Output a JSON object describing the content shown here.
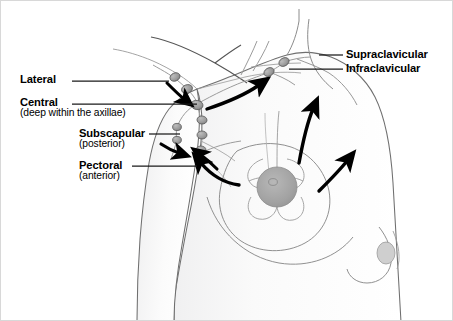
{
  "figure": {
    "background_color": "#ffffff",
    "width": 453,
    "height": 321
  },
  "labels": {
    "lateral": {
      "name": "Lateral",
      "qualifier": ""
    },
    "central": {
      "name": "Central",
      "qualifier": "(deep within the axillae)"
    },
    "subscapular": {
      "name": "Subscapular",
      "qualifier": "(posterior)"
    },
    "pectoral": {
      "name": "Pectoral",
      "qualifier": "(anterior)"
    },
    "supraclavicular": {
      "name": "Supraclavicular",
      "qualifier": ""
    },
    "infraclavicular": {
      "name": "Infraclavicular",
      "qualifier": ""
    }
  },
  "colors": {
    "text": "#000000",
    "leader_line": "#1a1a1a",
    "outline": "#6f6f6f",
    "skin_fill": "#fbfbfb",
    "skin_shade": "#ececed",
    "node_fill": "#9a9a9a",
    "node_stroke": "#5a5a5a",
    "vessel": "#8d8d8d",
    "arrow": "#000000",
    "nipple_fill": "#a6a6a6",
    "areola_stroke": "#9b9b9b"
  },
  "anatomy": {
    "nodes": [
      {
        "name": "lateral-node-1",
        "cx": 174,
        "cy": 76
      },
      {
        "name": "lateral-node-2",
        "cx": 186,
        "cy": 88
      },
      {
        "name": "central-node-1",
        "cx": 196,
        "cy": 103
      },
      {
        "name": "central-node-2",
        "cx": 201,
        "cy": 118
      },
      {
        "name": "central-node-3",
        "cx": 201,
        "cy": 133
      },
      {
        "name": "central-node-4",
        "cx": 200,
        "cy": 148
      },
      {
        "name": "subscapular-node-1",
        "cx": 176,
        "cy": 126
      },
      {
        "name": "subscapular-node-2",
        "cx": 176,
        "cy": 139
      },
      {
        "name": "infraclavicular-node",
        "cx": 268,
        "cy": 71
      },
      {
        "name": "supraclavicular-node",
        "cx": 283,
        "cy": 61
      }
    ],
    "arrows": [
      {
        "name": "arrow-lateral-inflow"
      },
      {
        "name": "arrow-subscapular-inflow"
      },
      {
        "name": "arrow-pectoral-inflow"
      },
      {
        "name": "arrow-breast-to-axilla"
      },
      {
        "name": "arrow-axilla-to-clavicle"
      },
      {
        "name": "arrow-breast-superior"
      },
      {
        "name": "arrow-breast-lateral"
      }
    ]
  }
}
